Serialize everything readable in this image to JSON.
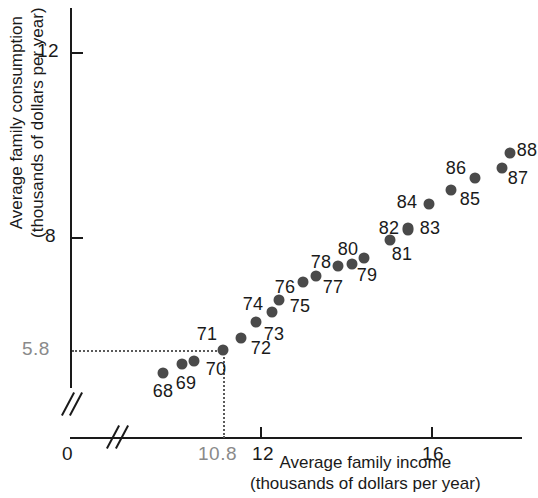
{
  "chart_data": {
    "type": "scatter",
    "title": "",
    "xlabel": "Average family income (thousands of dollars per year)",
    "ylabel": "Average family consumption (thousands of dollars per year)",
    "xlabel_line1": "Average family income",
    "xlabel_line2": "(thousands of dollars per year)",
    "ylabel_line1": "Average family consumption",
    "ylabel_line2": "(thousands of dollars per year)",
    "x_ticks": [
      "0",
      "10.8",
      "12",
      "16"
    ],
    "x_tick_values": [
      0,
      10.8,
      12,
      16
    ],
    "y_ticks": [
      "5.8",
      "8",
      "12"
    ],
    "y_tick_values": [
      5.8,
      8,
      12
    ],
    "xlim": [
      10.0,
      18.2
    ],
    "ylim": [
      5.0,
      12.6
    ],
    "grid": false,
    "legend": null,
    "axis_breaks": [
      "x-axis",
      "y-axis"
    ],
    "highlight": {
      "point_label": "71",
      "x_value": "10.8",
      "y_value": "5.8",
      "guide_style": "dotted"
    },
    "point_color": "#4a4a4a",
    "axis_color": "#1a1a1a",
    "muted_label_color": "#8a8a8a",
    "points": [
      {
        "label": "68",
        "x": 11.1,
        "y": 5.31,
        "px": 163,
        "py": 373,
        "lx": 163,
        "ly": 391
      },
      {
        "label": "69",
        "x": 11.56,
        "y": 5.5,
        "px": 182,
        "py": 364,
        "lx": 186,
        "ly": 383
      },
      {
        "label": "70",
        "x": 11.85,
        "y": 5.55,
        "px": 194,
        "py": 361,
        "lx": 216,
        "ly": 369
      },
      {
        "label": "71",
        "x": 12.53,
        "y": 5.8,
        "px": 223,
        "py": 350,
        "lx": 207,
        "ly": 334
      },
      {
        "label": "72",
        "x": 12.95,
        "y": 6.07,
        "px": 241,
        "py": 338,
        "lx": 261,
        "ly": 348
      },
      {
        "label": "73",
        "x": 13.3,
        "y": 6.42,
        "px": 256,
        "py": 322,
        "lx": 274,
        "ly": 334
      },
      {
        "label": "74",
        "x": 13.68,
        "y": 6.64,
        "px": 272,
        "py": 312,
        "lx": 253,
        "ly": 304
      },
      {
        "label": "75",
        "x": 13.84,
        "y": 6.9,
        "px": 279,
        "py": 300,
        "lx": 300,
        "ly": 306
      },
      {
        "label": "76",
        "x": 14.4,
        "y": 7.29,
        "px": 303,
        "py": 282,
        "lx": 285,
        "ly": 287
      },
      {
        "label": "77",
        "x": 14.7,
        "y": 7.42,
        "px": 316,
        "py": 276,
        "lx": 333,
        "ly": 287
      },
      {
        "label": "78",
        "x": 15.21,
        "y": 7.64,
        "px": 338,
        "py": 266,
        "lx": 321,
        "ly": 262
      },
      {
        "label": "79",
        "x": 15.54,
        "y": 7.68,
        "px": 352,
        "py": 264,
        "lx": 367,
        "ly": 275
      },
      {
        "label": "80",
        "x": 15.82,
        "y": 7.81,
        "px": 364,
        "py": 258,
        "lx": 348,
        "ly": 249
      },
      {
        "label": "81",
        "x": 16.43,
        "y": 8.2,
        "px": 390,
        "py": 240,
        "lx": 402,
        "ly": 254
      },
      {
        "label": "82",
        "x": 16.85,
        "y": 8.42,
        "px": 408,
        "py": 230,
        "lx": 389,
        "ly": 228
      },
      {
        "label": "83",
        "x": 16.85,
        "y": 8.47,
        "px": 408,
        "py": 228,
        "lx": 430,
        "ly": 228
      },
      {
        "label": "84",
        "x": 17.34,
        "y": 9.0,
        "px": 429,
        "py": 204,
        "lx": 407,
        "ly": 202
      },
      {
        "label": "85",
        "x": 17.86,
        "y": 9.3,
        "px": 451,
        "py": 190,
        "lx": 470,
        "ly": 199
      },
      {
        "label": "86",
        "x": 18.42,
        "y": 9.56,
        "px": 475,
        "py": 178,
        "lx": 456,
        "ly": 168
      },
      {
        "label": "87",
        "x": 19.05,
        "y": 9.78,
        "px": 502,
        "py": 168,
        "lx": 518,
        "ly": 178
      },
      {
        "label": "88",
        "x": 19.24,
        "y": 10.1,
        "px": 510,
        "py": 153,
        "lx": 527,
        "ly": 150
      }
    ]
  }
}
